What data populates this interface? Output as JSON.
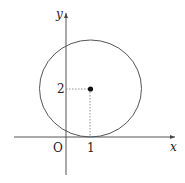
{
  "figure": {
    "type": "circle-on-coordinate-plane",
    "axes": {
      "x_label": "x",
      "y_label": "y",
      "origin_label": "O"
    },
    "circle": {
      "center": [
        1,
        2
      ],
      "radius": 2,
      "tangent_to": "x-axis"
    },
    "tick_labels": {
      "x_tick": "1",
      "y_tick": "2"
    },
    "colors": {
      "line": "#444444",
      "point": "#111111"
    }
  }
}
